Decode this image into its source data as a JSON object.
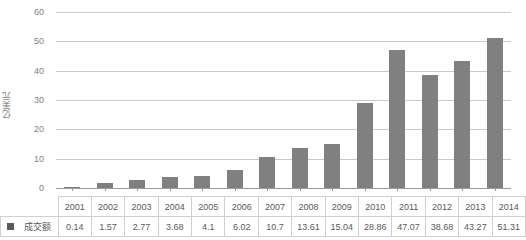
{
  "chart_data": {
    "type": "bar",
    "title": "",
    "xlabel": "",
    "ylabel": "亿美元",
    "ylim": [
      0,
      60
    ],
    "yticks": [
      0,
      10,
      20,
      30,
      40,
      50,
      60
    ],
    "grid": true,
    "legend_position": "table-row",
    "categories": [
      "2001",
      "2002",
      "2003",
      "2004",
      "2005",
      "2006",
      "2007",
      "2008",
      "2009",
      "2010",
      "2011",
      "2012",
      "2013",
      "2014"
    ],
    "series": [
      {
        "name": "成交额",
        "color": "#808080",
        "values": [
          0.14,
          1.57,
          2.77,
          3.68,
          4.1,
          6.02,
          10.7,
          13.61,
          15.04,
          28.86,
          47.07,
          38.68,
          43.27,
          51.31
        ]
      }
    ]
  },
  "table": {
    "legend_label": "成交额",
    "legend_marker": "square-marker",
    "year_header": [
      "2001",
      "2002",
      "2003",
      "2004",
      "2005",
      "2006",
      "2007",
      "2008",
      "2009",
      "2010",
      "2011",
      "2012",
      "2013",
      "2014"
    ],
    "value_row": [
      "0.14",
      "1.57",
      "2.77",
      "3.68",
      "4.1",
      "6.02",
      "10.7",
      "13.61",
      "15.04",
      "28.86",
      "47.07",
      "38.68",
      "43.27",
      "51.31"
    ]
  },
  "axis": {
    "y_title": "亿美元",
    "y_tick_labels": [
      "60",
      "50",
      "40",
      "30",
      "20",
      "10",
      "0"
    ]
  }
}
